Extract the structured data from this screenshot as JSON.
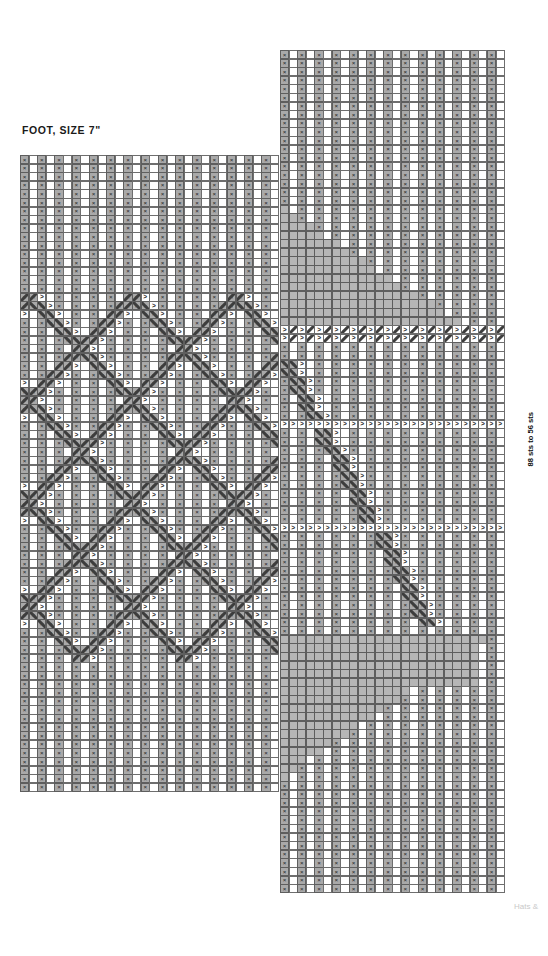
{
  "chart_title": "FOOT, SIZE 7\"",
  "side_label": "88 sts to 56 sts",
  "footer": "Hats &",
  "colors": {
    "knit_fill": "#a9a9a9",
    "purl_fill": "#ffffff",
    "no_stitch_fill": "#b6b6b6",
    "grid_line": "#5e5e5e",
    "symbol": "#1d1d1d",
    "footer_text": "#c9c9c9"
  },
  "symbols": {
    "knit": "×",
    "purl": "",
    "travel_right": ">",
    "travel_left": "<",
    "cable_right": "╱",
    "cable_left": "╲",
    "no_stitch": ""
  },
  "legend_note": "x = knit stitch, blank = purl stitch, diagonal = traveling/cable stitch, solid grey = no stitch",
  "grids": [
    {
      "name": "left-chart",
      "x": 20,
      "y": 155,
      "cell_w": 8.62,
      "cell_h": 8.6,
      "cols": 30,
      "rows": 74,
      "col_labels": [
        55,
        53,
        51,
        49,
        47,
        45,
        43,
        41,
        39,
        37,
        35,
        33,
        31,
        29,
        27
      ],
      "col_label_step": 2,
      "header_y": 140
    },
    {
      "name": "right-chart",
      "x": 280,
      "y": 50,
      "cell_w": 8.62,
      "cell_h": 8.6,
      "cols": 26,
      "rows": 98,
      "col_labels": [
        25,
        23,
        21,
        19,
        17,
        15,
        13,
        11,
        9,
        7,
        5,
        3,
        1
      ],
      "col_label_step": 2,
      "header_y": 26
    }
  ],
  "chart_data": {
    "type": "table",
    "title": "FOOT, SIZE 7\"",
    "stitch_count_note": "88 sts to 56 sts"
  }
}
